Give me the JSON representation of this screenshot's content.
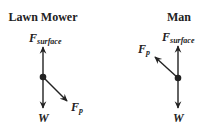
{
  "colors": {
    "ink": "#222222",
    "background": "#ffffff"
  },
  "panels": [
    {
      "title": "Lawn Mower",
      "forces": {
        "surface": {
          "symbol": "F",
          "subscript": "surface",
          "direction": "up"
        },
        "weight": {
          "symbol": "W",
          "direction": "down"
        },
        "push": {
          "symbol": "F",
          "subscript": "p",
          "direction": "down-right"
        }
      }
    },
    {
      "title": "Man",
      "forces": {
        "surface": {
          "symbol": "F",
          "subscript": "surface",
          "direction": "up"
        },
        "weight": {
          "symbol": "W",
          "direction": "down"
        },
        "push": {
          "symbol": "F",
          "subscript": "p",
          "direction": "up-left"
        }
      }
    }
  ]
}
